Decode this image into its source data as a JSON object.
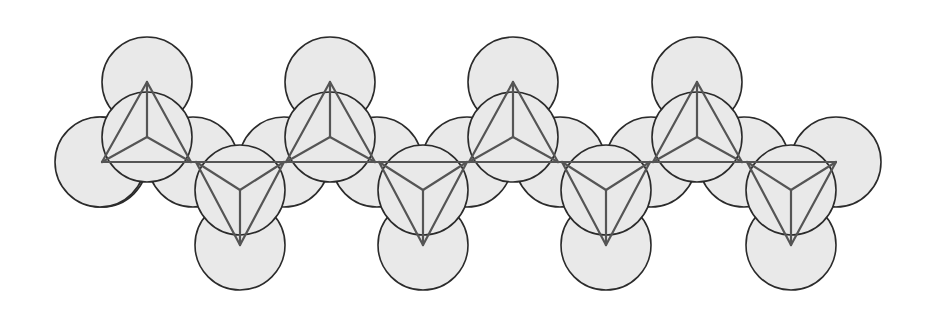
{
  "diagram": {
    "title": "",
    "colors": {
      "sphere_fill": "#e9e9e9",
      "sphere_stroke": "#2b2b2b",
      "edge": "#555555",
      "background": "#ffffff"
    },
    "radius": 45,
    "baseline_y": 162,
    "up_tetrahedra": [
      {
        "apex": [
          147,
          82
        ],
        "left": [
          102,
          162
        ],
        "right": [
          191,
          162
        ],
        "center": [
          147,
          137
        ]
      },
      {
        "apex": [
          330,
          82
        ],
        "left": [
          286,
          162
        ],
        "right": [
          375,
          162
        ],
        "center": [
          330,
          137
        ]
      },
      {
        "apex": [
          513,
          82
        ],
        "left": [
          469,
          162
        ],
        "right": [
          558,
          162
        ],
        "center": [
          513,
          137
        ]
      },
      {
        "apex": [
          697,
          82
        ],
        "left": [
          653,
          162
        ],
        "right": [
          742,
          162
        ],
        "center": [
          697,
          137
        ]
      }
    ],
    "down_tetrahedra": [
      {
        "apex": [
          240,
          245
        ],
        "left": [
          196,
          162
        ],
        "right": [
          284,
          162
        ],
        "center": [
          240,
          190
        ]
      },
      {
        "apex": [
          423,
          245
        ],
        "left": [
          379,
          162
        ],
        "right": [
          467,
          162
        ],
        "center": [
          423,
          190
        ]
      },
      {
        "apex": [
          606,
          245
        ],
        "left": [
          562,
          162
        ],
        "right": [
          650,
          162
        ],
        "center": [
          606,
          190
        ]
      },
      {
        "apex": [
          791,
          245
        ],
        "left": [
          747,
          162
        ],
        "right": [
          836,
          162
        ],
        "center": [
          791,
          190
        ]
      }
    ]
  }
}
